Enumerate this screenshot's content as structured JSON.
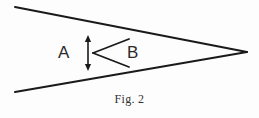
{
  "figure": {
    "caption": "Fig. 2",
    "background_color": "#fdfdfd",
    "ink_color": "#1a1a1a",
    "labels": {
      "region_a": "A",
      "region_b": "B"
    },
    "geometry": {
      "canvas": {
        "width": 259,
        "height": 118
      },
      "outer_wedge": {
        "description": "two straight lines converging to a point at the right",
        "apex": {
          "x": 247,
          "y": 52
        },
        "top_line": {
          "x1": 15,
          "y1": 7,
          "x2": 247,
          "y2": 52
        },
        "bottom_line": {
          "x1": 15,
          "y1": 92,
          "x2": 247,
          "y2": 52
        },
        "stroke_width": 2.0
      },
      "inner_wedge": {
        "description": "smaller V opening to the right, vertex inside the outer wedge",
        "vertex": {
          "x": 93,
          "y": 53
        },
        "upper_arm_end": {
          "x": 129,
          "y": 39
        },
        "lower_arm_end": {
          "x": 129,
          "y": 67
        },
        "stroke_width": 1.8
      },
      "dimension_arrow": {
        "description": "vertical double-headed arrow marking the gap height",
        "x": 88,
        "y_top": 36,
        "y_bottom": 70,
        "stroke_width": 1.6,
        "arrowhead_half_width": 3.2,
        "arrowhead_length": 6
      }
    }
  }
}
